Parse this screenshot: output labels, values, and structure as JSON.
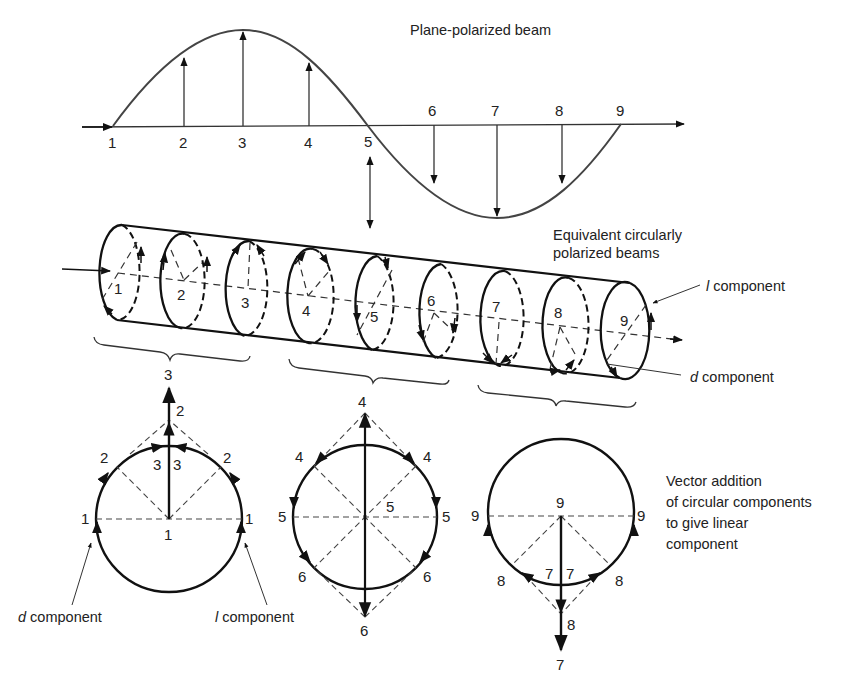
{
  "plane_beam": {
    "title": "Plane-polarized beam",
    "points": [
      "1",
      "2",
      "3",
      "4",
      "5",
      "6",
      "7",
      "8",
      "9"
    ]
  },
  "circular_beams": {
    "title_line1": "Equivalent circularly",
    "title_line2": "polarized beams",
    "l_label_italic": "l",
    "l_label_rest": " component",
    "d_label_italic": "d",
    "d_label_rest": " component",
    "ellipses": [
      "1",
      "2",
      "3",
      "4",
      "5",
      "6",
      "7",
      "8",
      "9"
    ]
  },
  "groups": {
    "first_label": "3",
    "second_label": "4"
  },
  "vector_diagram_1": {
    "top": "3",
    "upper_mid": "2",
    "left2": "2",
    "right2": "2",
    "inner_left3": "3",
    "inner_right3": "3",
    "left1": "1",
    "right1": "1",
    "center1": "1",
    "d_italic": "d",
    "d_rest": " component",
    "l_italic": "l",
    "l_rest": " component"
  },
  "vector_diagram_2": {
    "top": "4",
    "left4": "4",
    "right4": "4",
    "left5": "5",
    "right5": "5",
    "center5": "5",
    "left6": "6",
    "right6": "6",
    "bottom": "6"
  },
  "vector_diagram_3": {
    "center9": "9",
    "left9": "9",
    "right9": "9",
    "inner_left7": "7",
    "inner_right7": "7",
    "left8": "8",
    "right8": "8",
    "lower8": "8",
    "bottom": "7"
  },
  "caption": {
    "line1": "Vector addition",
    "line2": "of circular components",
    "line3": "to give linear",
    "line4": "component"
  }
}
